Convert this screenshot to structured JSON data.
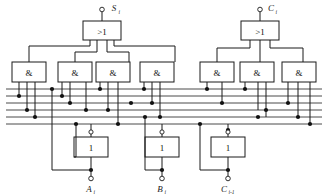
{
  "diagram": {
    "colors": {
      "line": "#1a1a1a",
      "bus": "#4a4a4a",
      "junction": "#111111",
      "background": "#ffffff"
    }
  },
  "or_gates": [
    {
      "id": "or-sum",
      "label": ">1",
      "output_port": "S",
      "output_sub": "i"
    },
    {
      "id": "or-carry",
      "label": ">1",
      "output_port": "C",
      "output_sub": "i"
    }
  ],
  "and_gates": [
    {
      "id": "and-1",
      "label": "&"
    },
    {
      "id": "and-2",
      "label": "&"
    },
    {
      "id": "and-3",
      "label": "&"
    },
    {
      "id": "and-4",
      "label": "&"
    },
    {
      "id": "and-5",
      "label": "&"
    },
    {
      "id": "and-6",
      "label": "&"
    },
    {
      "id": "and-7",
      "label": "&"
    }
  ],
  "inverters": [
    {
      "id": "inv-a",
      "label": "1",
      "input_port": "A",
      "input_sub": "i"
    },
    {
      "id": "inv-b",
      "label": "1",
      "input_port": "B",
      "input_sub": "i"
    },
    {
      "id": "inv-c",
      "label": "1",
      "input_port": "C",
      "input_sub": "i-1"
    }
  ],
  "input_terminals": [
    {
      "id": "in-a",
      "label": "A",
      "sub": "i"
    },
    {
      "id": "in-b",
      "label": "B",
      "sub": "i"
    },
    {
      "id": "in-c",
      "label": "C",
      "sub": "i-1"
    }
  ],
  "output_terminals": [
    {
      "id": "out-s",
      "label": "S",
      "sub": "i"
    },
    {
      "id": "out-c",
      "label": "C",
      "sub": "i"
    }
  ],
  "bus_lines": {
    "count": 6,
    "description": "six horizontal signal rails carrying A, A-bar, B, B-bar, C, C-bar"
  }
}
